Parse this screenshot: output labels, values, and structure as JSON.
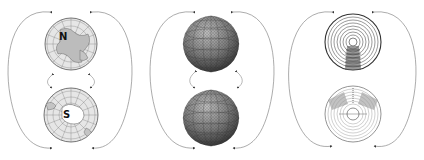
{
  "diagram": {
    "background": "#ffffff",
    "line_color": "#666666",
    "panels": [
      {
        "id": "map-globes",
        "style": "polar-map",
        "top": {
          "cx": 71,
          "cy": 44,
          "r": 26,
          "label": "N"
        },
        "bottom": {
          "cx": 71,
          "cy": 115,
          "r": 27,
          "label": "S"
        }
      },
      {
        "id": "shaded-spheres",
        "style": "shaded-sphere",
        "top": {
          "cx": 211,
          "cy": 44,
          "r": 28,
          "label": ""
        },
        "bottom": {
          "cx": 211,
          "cy": 118,
          "r": 28,
          "label": ""
        }
      },
      {
        "id": "concentric-disks",
        "style": "concentric-disk",
        "top": {
          "cx": 353,
          "cy": 42,
          "r": 28,
          "label": ""
        },
        "bottom": {
          "cx": 353,
          "cy": 114,
          "r": 28,
          "label": ""
        }
      }
    ]
  }
}
